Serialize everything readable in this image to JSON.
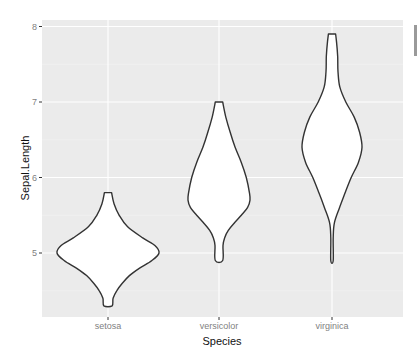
{
  "chart_data": {
    "type": "violin",
    "title": "",
    "xlabel": "Species",
    "ylabel": "Sepal.Length",
    "categories": [
      "setosa",
      "versicolor",
      "virginica"
    ],
    "ylim": [
      4.2,
      8.05
    ],
    "yticks": [
      5,
      6,
      7,
      8
    ],
    "ytick_labels": [
      "5",
      "6",
      "7",
      "8"
    ],
    "grid": true,
    "legend": "none",
    "series": [
      {
        "name": "setosa",
        "min": 4.3,
        "max": 5.8,
        "mode": 5.0,
        "outline": [
          [
            5.8,
            0.07
          ],
          [
            5.65,
            0.12
          ],
          [
            5.5,
            0.22
          ],
          [
            5.35,
            0.38
          ],
          [
            5.2,
            0.68
          ],
          [
            5.1,
            0.92
          ],
          [
            5.0,
            1.0
          ],
          [
            4.9,
            0.86
          ],
          [
            4.8,
            0.62
          ],
          [
            4.7,
            0.42
          ],
          [
            4.6,
            0.28
          ],
          [
            4.5,
            0.17
          ],
          [
            4.4,
            0.1
          ],
          [
            4.3,
            0.08
          ]
        ]
      },
      {
        "name": "versicolor",
        "min": 4.9,
        "max": 7.0,
        "mode": 5.7,
        "outline": [
          [
            7.0,
            0.12
          ],
          [
            6.8,
            0.22
          ],
          [
            6.6,
            0.36
          ],
          [
            6.4,
            0.52
          ],
          [
            6.2,
            0.72
          ],
          [
            6.0,
            0.88
          ],
          [
            5.8,
            0.98
          ],
          [
            5.7,
            1.0
          ],
          [
            5.6,
            0.92
          ],
          [
            5.5,
            0.72
          ],
          [
            5.4,
            0.5
          ],
          [
            5.3,
            0.3
          ],
          [
            5.2,
            0.18
          ],
          [
            5.1,
            0.13
          ],
          [
            4.9,
            0.12
          ]
        ]
      },
      {
        "name": "virginica",
        "min": 4.9,
        "max": 7.9,
        "mode": 6.4,
        "outline": [
          [
            7.9,
            0.12
          ],
          [
            7.8,
            0.15
          ],
          [
            7.6,
            0.19
          ],
          [
            7.4,
            0.2
          ],
          [
            7.2,
            0.26
          ],
          [
            7.0,
            0.46
          ],
          [
            6.8,
            0.74
          ],
          [
            6.6,
            0.92
          ],
          [
            6.4,
            1.0
          ],
          [
            6.2,
            0.88
          ],
          [
            6.0,
            0.64
          ],
          [
            5.8,
            0.44
          ],
          [
            5.6,
            0.25
          ],
          [
            5.4,
            0.08
          ],
          [
            5.2,
            0.04
          ],
          [
            4.9,
            0.04
          ]
        ]
      }
    ]
  },
  "axes": {
    "x_title": "Species",
    "y_title": "Sepal.Length"
  },
  "colors": {
    "panel_bg": "#EBEBEB",
    "grid_major": "#FFFFFF",
    "grid_minor": "#F4F4F4",
    "violin_fill": "#FFFFFF",
    "violin_stroke": "#333333",
    "tick_text": "#7F7F7F",
    "title_text": "#111111"
  }
}
